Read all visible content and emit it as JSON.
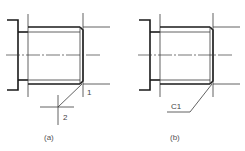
{
  "figure": {
    "panels": [
      {
        "id": "a",
        "caption": "(a)",
        "callouts": [
          {
            "label": "1"
          },
          {
            "label": "2"
          }
        ]
      },
      {
        "id": "b",
        "caption": "(b)",
        "callouts": [
          {
            "label": "C1"
          }
        ]
      }
    ],
    "colors": {
      "line": "#1a1a1a",
      "thin_line": "#3a3a3a",
      "background": "#ffffff"
    }
  }
}
